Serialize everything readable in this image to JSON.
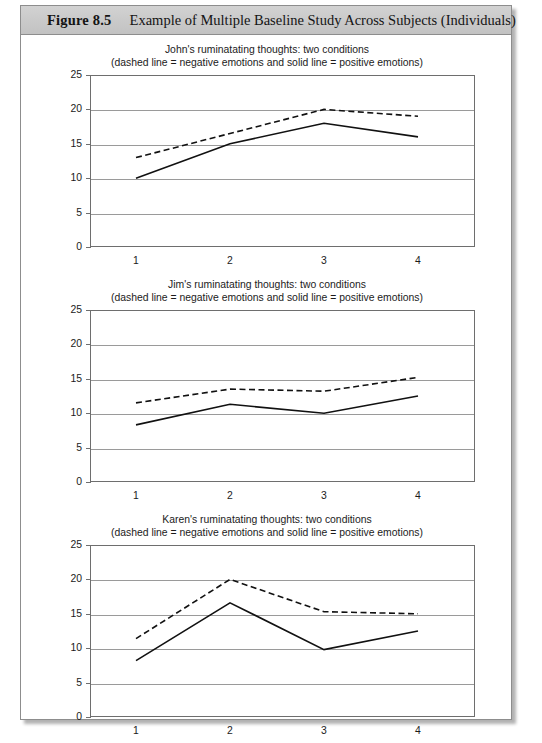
{
  "figure": {
    "number": "Figure 8.5",
    "caption": "Example of Multiple Baseline Study Across Subjects (Individuals)"
  },
  "axis": {
    "y_ticks": [
      "25",
      "20",
      "15",
      "10",
      "5",
      "0"
    ],
    "x_ticks": [
      "1",
      "2",
      "3",
      "4"
    ]
  },
  "chart_data": [
    {
      "type": "line",
      "title": "John's ruminatating thoughts: two conditions",
      "subtitle": "(dashed line = negative emotions and solid line = positive emotions)",
      "xlabel": "",
      "ylabel": "",
      "x": [
        1,
        2,
        3,
        4
      ],
      "xtick_labels": [
        "1",
        "2",
        "3",
        "4"
      ],
      "ylim": [
        0,
        25
      ],
      "ytick_values": [
        0,
        5,
        10,
        15,
        20,
        25
      ],
      "grid": true,
      "legend_position": "none",
      "series": [
        {
          "name": "negative emotions",
          "style": "dashed",
          "values": [
            13,
            16.5,
            20,
            19
          ]
        },
        {
          "name": "positive emotions",
          "style": "solid",
          "values": [
            10,
            15,
            18,
            16
          ]
        }
      ]
    },
    {
      "type": "line",
      "title": "Jim's ruminatating thoughts: two conditions",
      "subtitle": "(dashed line = negative emotions and solid line = positive emotions)",
      "xlabel": "",
      "ylabel": "",
      "x": [
        1,
        2,
        3,
        4
      ],
      "xtick_labels": [
        "1",
        "2",
        "3",
        "4"
      ],
      "ylim": [
        0,
        25
      ],
      "ytick_values": [
        0,
        5,
        10,
        15,
        20,
        25
      ],
      "grid": true,
      "legend_position": "none",
      "series": [
        {
          "name": "negative emotions",
          "style": "dashed",
          "values": [
            11.5,
            13.5,
            13.2,
            15.2
          ]
        },
        {
          "name": "positive emotions",
          "style": "solid",
          "values": [
            8.3,
            11.3,
            10,
            12.5
          ]
        }
      ]
    },
    {
      "type": "line",
      "title": "Karen's ruminatating thoughts: two conditions",
      "subtitle": "(dashed line = negative emotions and solid line = positive emotions)",
      "xlabel": "",
      "ylabel": "",
      "x": [
        1,
        2,
        3,
        4
      ],
      "xtick_labels": [
        "1",
        "2",
        "3",
        "4"
      ],
      "ylim": [
        0,
        25
      ],
      "ytick_values": [
        0,
        5,
        10,
        15,
        20,
        25
      ],
      "grid": true,
      "legend_position": "none",
      "series": [
        {
          "name": "negative emotions",
          "style": "dashed",
          "values": [
            11.4,
            20,
            15.3,
            15
          ]
        },
        {
          "name": "positive emotions",
          "style": "solid",
          "values": [
            8.2,
            16.6,
            9.8,
            12.5
          ]
        }
      ]
    }
  ],
  "colors": {
    "line": "#111111",
    "grid": "#9a9a9a",
    "plot_border": "#6e6e6e",
    "header_bar": "#c8c8c8",
    "frame_border": "#8d8d8d"
  }
}
